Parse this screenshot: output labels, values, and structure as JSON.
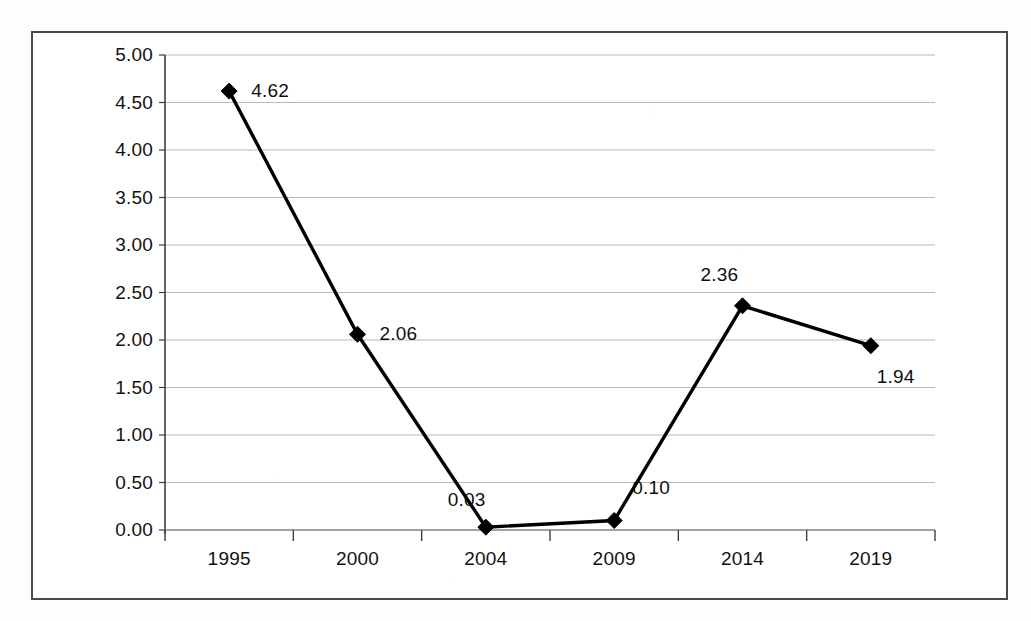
{
  "chart_data": {
    "type": "line",
    "title": "",
    "subtitle": "",
    "xlabel": "",
    "ylabel": "",
    "categories": [
      "1995",
      "2000",
      "2004",
      "2009",
      "2014",
      "2019"
    ],
    "values": [
      4.62,
      2.06,
      0.03,
      0.1,
      2.36,
      1.94
    ],
    "point_labels": [
      "4.62",
      "2.06",
      "0.03",
      "0.10",
      "2.36",
      "1.94"
    ],
    "series": [
      {
        "name": "",
        "values": [
          4.62,
          2.06,
          0.03,
          0.1,
          2.36,
          1.94
        ]
      }
    ],
    "ylim": [
      0.0,
      5.0
    ],
    "ytick_step": 0.5,
    "ytick_labels": [
      "0.00",
      "0.50",
      "1.00",
      "1.50",
      "2.00",
      "2.50",
      "3.00",
      "3.50",
      "4.00",
      "4.50",
      "5.00"
    ],
    "ytick_values": [
      0.0,
      0.5,
      1.0,
      1.5,
      2.0,
      2.5,
      3.0,
      3.5,
      4.0,
      4.5,
      5.0
    ],
    "grid": true,
    "grid_axis": "y",
    "legend": false,
    "legend_position": "none",
    "marker": "diamond",
    "line_color": "#000000",
    "marker_color": "#000000",
    "grid_color": "#b9b9b9",
    "axis_color": "#555555",
    "plot_background": "#ffffff",
    "border_color": "#4a4a4a"
  },
  "label_offsets": [
    {
      "dx": 22,
      "dy": -11
    },
    {
      "dx": 22,
      "dy": -11
    },
    {
      "dx": -38,
      "dy": -38
    },
    {
      "dx": 18,
      "dy": -44
    },
    {
      "dx": -42,
      "dy": -42
    },
    {
      "dx": 6,
      "dy": 20
    }
  ]
}
